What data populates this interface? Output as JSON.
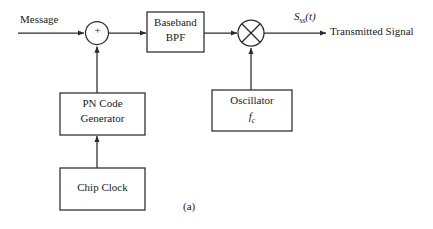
{
  "figure": {
    "caption": "(a)",
    "stroke_color": "#2b2b2b",
    "text_color": "#1a1a1a",
    "background_color": "#ffffff"
  },
  "signals": {
    "message_label": "Message",
    "output_symbol_base": "S",
    "output_symbol_subscript": "ss",
    "output_symbol_arg": "(t)",
    "output_label": "Transmitted Signal"
  },
  "nodes": {
    "summer": {
      "symbol": "+",
      "name": "summing-junction"
    },
    "mixer": {
      "symbol": "×",
      "name": "multiplier"
    }
  },
  "blocks": [
    {
      "id": "baseband-bpf",
      "line1": "Baseband",
      "line2": "BPF"
    },
    {
      "id": "pn-code-generator",
      "line1": "PN Code",
      "line2": "Generator"
    },
    {
      "id": "chip-clock",
      "line1": "Chip Clock",
      "line2": ""
    },
    {
      "id": "oscillator",
      "line1": "Oscillator",
      "line2_base": "f",
      "line2_sub": "c"
    }
  ]
}
